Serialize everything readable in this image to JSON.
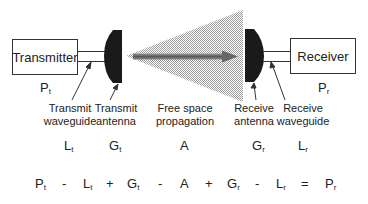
{
  "diagram": {
    "title": "",
    "type": "link budget block diagram",
    "blocks": {
      "transmitter": {
        "label": "Transmitter",
        "power_symbol": "P",
        "power_sub": "t"
      },
      "receiver": {
        "label": "Receiver",
        "power_symbol": "P",
        "power_sub": "r"
      }
    },
    "stages": [
      {
        "id": "transmit-waveguide",
        "line1": "Transmit",
        "line2": "waveguide",
        "symbol": "L",
        "sub": "t"
      },
      {
        "id": "transmit-antenna",
        "line1": "Transmit",
        "line2": "antenna",
        "symbol": "G",
        "sub": "t"
      },
      {
        "id": "free-space",
        "line1": "Free space",
        "line2": "propagation",
        "symbol": "A",
        "sub": ""
      },
      {
        "id": "receive-antenna",
        "line1": "Receive",
        "line2": "antenna",
        "symbol": "G",
        "sub": "r"
      },
      {
        "id": "receive-waveguide",
        "line1": "Receive",
        "line2": "waveguide",
        "symbol": "L",
        "sub": "r"
      }
    ],
    "equation": [
      {
        "sym": "P",
        "sub": "t"
      },
      {
        "op": "-"
      },
      {
        "sym": "L",
        "sub": "t"
      },
      {
        "op": "+"
      },
      {
        "sym": "G",
        "sub": "t"
      },
      {
        "op": "-"
      },
      {
        "sym": "A",
        "sub": ""
      },
      {
        "op": "+"
      },
      {
        "sym": "G",
        "sub": "r"
      },
      {
        "op": "-"
      },
      {
        "sym": "L",
        "sub": "r"
      },
      {
        "op": "="
      },
      {
        "sym": "P",
        "sub": "r"
      }
    ],
    "colors": {
      "line": "#333333",
      "antenna": "#1a1a1a",
      "cone": "#c8c8c8",
      "arrow": "#777777"
    }
  }
}
